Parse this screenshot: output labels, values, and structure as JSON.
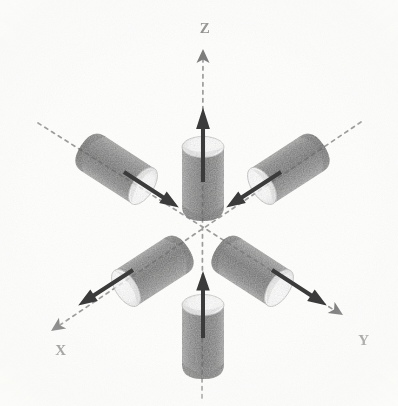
{
  "figure": {
    "background_color": "#fdfdfc",
    "ink_color": "#6f6f6f",
    "arrow_color": "#3c3c3c",
    "axis_color": "#9a9a9a",
    "cylinder_body_color": "#7a7a7a",
    "cylinder_cap_color": "#ffffff",
    "canvas": {
      "width": 398,
      "height": 406
    },
    "origin": {
      "x": 202,
      "y": 222
    }
  },
  "axes": [
    {
      "id": "z-axis",
      "label": "Z",
      "label_x": 205,
      "label_y": 33,
      "tip_x": 203,
      "tip_y": 49,
      "tail_x": 202,
      "tail_y": 398,
      "arrowhead": true,
      "style": "dashed"
    },
    {
      "id": "x-axis",
      "label": "X",
      "label_x": 61,
      "label_y": 355,
      "tip_x": 51,
      "tip_y": 331,
      "tail_x": 361,
      "tail_y": 122,
      "arrowhead": true,
      "style": "dashed"
    },
    {
      "id": "y-axis",
      "label": "Y",
      "label_x": 364,
      "label_y": 345,
      "tip_x": 343,
      "tip_y": 315,
      "tail_x": 38,
      "tail_y": 123,
      "arrowhead": true,
      "style": "dashed"
    }
  ],
  "cylinders": [
    {
      "id": "cylinder-z-positive",
      "axis": "Z",
      "position": "upper-center",
      "arrow_direction": "up",
      "arrow_points": "outward",
      "cx": 203,
      "cy": 172,
      "angle_deg": -90,
      "length": 72,
      "radius": 22
    },
    {
      "id": "cylinder-z-negative",
      "axis": "Z",
      "position": "lower-center",
      "arrow_direction": "up",
      "arrow_points": "inward",
      "cx": 203,
      "cy": 330,
      "angle_deg": -90,
      "length": 72,
      "radius": 22
    },
    {
      "id": "cylinder-x-negative",
      "axis": "X",
      "position": "upper-left",
      "arrow_direction": "down-right",
      "arrow_points": "inward",
      "cx": 103,
      "cy": 158,
      "angle_deg": 33,
      "length": 72,
      "radius": 21
    },
    {
      "id": "cylinder-x-positive",
      "axis": "X",
      "position": "lower-right",
      "arrow_direction": "down-right",
      "arrow_points": "outward",
      "cx": 256,
      "cy": 262,
      "angle_deg": 33,
      "length": 68,
      "radius": 21
    },
    {
      "id": "cylinder-y-negative",
      "axis": "Y",
      "position": "upper-right",
      "arrow_direction": "down-left",
      "arrow_points": "inward",
      "cx": 300,
      "cy": 158,
      "angle_deg": 147,
      "length": 72,
      "radius": 21
    },
    {
      "id": "cylinder-y-positive",
      "axis": "Y",
      "position": "lower-left",
      "arrow_direction": "down-left",
      "arrow_points": "outward",
      "cx": 150,
      "cy": 262,
      "angle_deg": 147,
      "length": 68,
      "radius": 21
    }
  ],
  "force_arrows": [
    {
      "id": "arrow-z-positive",
      "x1": 203,
      "y1": 182,
      "x2": 203,
      "y2": 98,
      "direction": "up"
    },
    {
      "id": "arrow-z-negative",
      "x1": 203,
      "y1": 338,
      "x2": 203,
      "y2": 272,
      "direction": "up"
    },
    {
      "id": "arrow-x-upper-left",
      "x1": 126,
      "y1": 174,
      "x2": 173,
      "y2": 206,
      "direction": "down-right"
    },
    {
      "id": "arrow-x-lower-right",
      "x1": 275,
      "y1": 272,
      "x2": 322,
      "y2": 303,
      "direction": "down-right"
    },
    {
      "id": "arrow-y-upper-right",
      "x1": 279,
      "y1": 174,
      "x2": 232,
      "y2": 206,
      "direction": "down-left"
    },
    {
      "id": "arrow-y-lower-left",
      "x1": 130,
      "y1": 272,
      "x2": 83,
      "y2": 303,
      "direction": "down-left"
    }
  ]
}
